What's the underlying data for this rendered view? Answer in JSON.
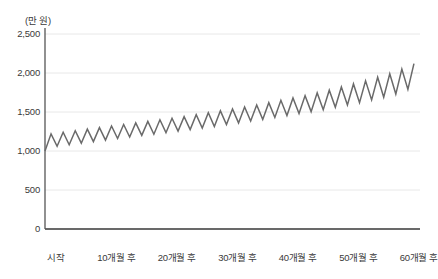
{
  "chart_data": {
    "type": "line",
    "title": "",
    "subtitle": "",
    "xlabel": "",
    "ylabel": "",
    "unit_label": "(만 원)",
    "grid": true,
    "legend": "none",
    "line_color": "#6a6a6a",
    "grid_color": "#e8e8e8",
    "axis_color": "#555555",
    "background": "#ffffff",
    "xlim": [
      0,
      62
    ],
    "ylim": [
      0,
      2500
    ],
    "ytick_values": [
      0,
      500,
      1000,
      1500,
      2000,
      2500
    ],
    "ytick_labels": [
      "0",
      "500",
      "1,000",
      "1,500",
      "2,000",
      "2,500"
    ],
    "xtick_values": [
      0,
      10,
      20,
      30,
      40,
      50,
      60
    ],
    "xtick_labels": [
      "시작",
      "10개월 후",
      "20개월 후",
      "30개월 후",
      "40개월 후",
      "50개월 후",
      "60개월 후"
    ],
    "series": [
      {
        "name": "적립금",
        "x": [
          0,
          1,
          2,
          3,
          4,
          5,
          6,
          7,
          8,
          9,
          10,
          11,
          12,
          13,
          14,
          15,
          16,
          17,
          18,
          19,
          20,
          21,
          22,
          23,
          24,
          25,
          26,
          27,
          28,
          29,
          30,
          31,
          32,
          33,
          34,
          35,
          36,
          37,
          38,
          39,
          40,
          41,
          42,
          43,
          44,
          45,
          46,
          47,
          48,
          49,
          50,
          51,
          52,
          53,
          54,
          55,
          56,
          57,
          58,
          59,
          60,
          61
        ],
        "values": [
          1000,
          1220,
          1060,
          1240,
          1080,
          1260,
          1100,
          1280,
          1120,
          1300,
          1140,
          1320,
          1160,
          1340,
          1180,
          1360,
          1200,
          1380,
          1215,
          1400,
          1235,
          1420,
          1255,
          1440,
          1275,
          1465,
          1295,
          1490,
          1315,
          1515,
          1340,
          1540,
          1360,
          1565,
          1385,
          1590,
          1405,
          1620,
          1430,
          1650,
          1455,
          1680,
          1480,
          1710,
          1505,
          1745,
          1530,
          1780,
          1560,
          1820,
          1590,
          1860,
          1620,
          1900,
          1655,
          1945,
          1690,
          1990,
          1730,
          2050,
          1790,
          2120
        ]
      }
    ],
    "annotations": []
  }
}
